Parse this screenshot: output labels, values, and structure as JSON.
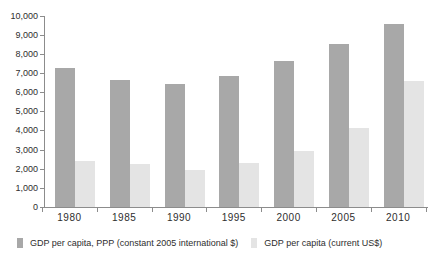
{
  "chart_data": {
    "type": "bar",
    "title": "",
    "categories": [
      "1980",
      "1985",
      "1990",
      "1995",
      "2000",
      "2005",
      "2010"
    ],
    "series": [
      {
        "name": "GDP per capita, PPP (constant 2005 international $)",
        "color": "#a8a8a8",
        "values": [
          7250,
          6650,
          6400,
          6850,
          7650,
          8500,
          9550
        ]
      },
      {
        "name": "GDP per capita (current US$)",
        "color": "#e4e4e4",
        "values": [
          2400,
          2250,
          1950,
          2300,
          2900,
          4100,
          6600
        ]
      }
    ],
    "xlabel": "",
    "ylabel": "",
    "ylim": [
      0,
      10000
    ],
    "ytick_step": 1000,
    "ytick_labels": [
      "0",
      "1,000",
      "2,000",
      "3,000",
      "4,000",
      "5,000",
      "6,000",
      "7,000",
      "8,000",
      "9,000",
      "10,000"
    ],
    "grid": false,
    "legend_position": "bottom"
  },
  "colors": {
    "axis": "#8c8c8c",
    "text": "#2e2e2e",
    "background": "#ffffff"
  }
}
